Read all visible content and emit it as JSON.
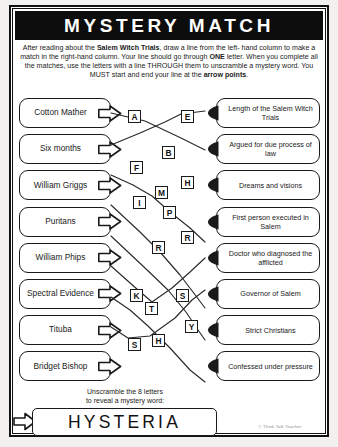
{
  "worksheet": {
    "title": "MYSTERY MATCH",
    "instructions_html": "After reading about the <b>Salem Witch Trials</b>, draw a line from the left- hand column to make a match in the right-hand column. Your line should go through <b>ONE</b> letter. When you complete all the matches, use the letters with a line THROUGH them to unscramble a mystery word. You MUST start and end your line at the <b>arrow points</b>.",
    "credit": "© Think Talk Teacher"
  },
  "left_column": [
    {
      "label": "Cotton Mather"
    },
    {
      "label": "Six months"
    },
    {
      "label": "William Griggs"
    },
    {
      "label": "Puritans"
    },
    {
      "label": "William Phips"
    },
    {
      "label": "Spectral Evidence"
    },
    {
      "label": "Tituba"
    },
    {
      "label": "Bridget Bishop"
    }
  ],
  "right_column": [
    {
      "label": "Length of the Salem Witch Trials"
    },
    {
      "label": "Argued for due process of law"
    },
    {
      "label": "Dreams and visions"
    },
    {
      "label": "First person executed in Salem"
    },
    {
      "label": "Doctor who diagnosed the afflicted"
    },
    {
      "label": "Governor of Salem"
    },
    {
      "label": "Strict Christians"
    },
    {
      "label": "Confessed under pressure"
    }
  ],
  "letters": [
    {
      "char": "A",
      "x": 128,
      "y": 110
    },
    {
      "char": "E",
      "x": 181,
      "y": 110
    },
    {
      "char": "B",
      "x": 162,
      "y": 146
    },
    {
      "char": "F",
      "x": 130,
      "y": 161
    },
    {
      "char": "H",
      "x": 181,
      "y": 176
    },
    {
      "char": "M",
      "x": 155,
      "y": 186
    },
    {
      "char": "I",
      "x": 133,
      "y": 196
    },
    {
      "char": "P",
      "x": 163,
      "y": 206
    },
    {
      "char": "R",
      "x": 181,
      "y": 231
    },
    {
      "char": "R",
      "x": 152,
      "y": 241
    },
    {
      "char": "K",
      "x": 130,
      "y": 289
    },
    {
      "char": "S",
      "x": 176,
      "y": 289
    },
    {
      "char": "T",
      "x": 145,
      "y": 302
    },
    {
      "char": "Y",
      "x": 185,
      "y": 320
    },
    {
      "char": "S",
      "x": 128,
      "y": 338
    },
    {
      "char": "H",
      "x": 152,
      "y": 334
    }
  ],
  "match_lines": [
    {
      "points": "111,113 128,117 145,121 181,138 205,150"
    },
    {
      "points": "111,145 140,133 165,122 181,114 205,111"
    },
    {
      "points": "111,175 133,185 152,196 170,212 190,228 205,242"
    },
    {
      "points": "111,205 140,232 160,252 180,275 196,296 205,308"
    },
    {
      "points": "111,236 145,268 168,290 186,312 198,330 205,340"
    },
    {
      "points": "111,266 138,290 152,302 172,288 190,272 205,258"
    },
    {
      "points": "111,297 130,310 148,326 170,348 190,370 205,382"
    },
    {
      "points": "111,327 128,338 150,336 175,318 192,300 205,290"
    }
  ],
  "answer": {
    "prompt_line1": "Unscramble the 8 letters",
    "prompt_line2": "to reveal a mystery word:",
    "word": "HYSTERIA"
  }
}
